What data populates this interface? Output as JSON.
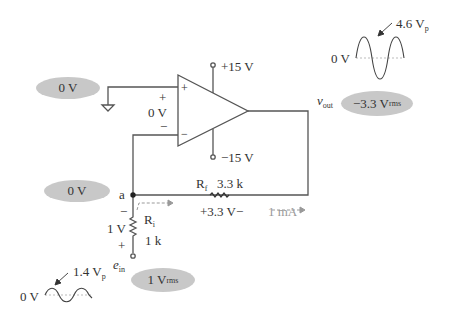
{
  "circuit": {
    "type": "inverting op-amp amplifier",
    "supply_pos": "+15 V",
    "supply_neg": "−15 V",
    "opamp_plus_sign": "+",
    "opamp_minus_sign": "−",
    "diff_plus": "+",
    "diff_voltage": "0 V",
    "diff_minus": "−",
    "node_a_label": "a",
    "rf_name": "R",
    "rf_sub": "f",
    "rf_value": "3.3 k",
    "rf_drop": "+3.3 V−",
    "current_label": "1 mA",
    "ri_name": "R",
    "ri_sub": "i",
    "ri_value": "1 k",
    "ri_minus": "−",
    "ri_drop": "1 V",
    "ri_plus": "+",
    "ein_name": "e",
    "ein_sub": "in",
    "vout_name": "v",
    "vout_sub": "out"
  },
  "badges": {
    "noninv_input": "0 V",
    "node_a": "0 V",
    "input_main": "1 V",
    "input_sub": "rms",
    "output_main": "−3.3 V",
    "output_sub": "rms"
  },
  "waveforms": {
    "output": {
      "zero_label": "0 V",
      "peak_main": "4.6 V",
      "peak_sub": "p"
    },
    "input": {
      "zero_label": "0 V",
      "peak_main": "1.4 V",
      "peak_sub": "p"
    }
  },
  "colors": {
    "wire": "#555555",
    "badge": "#c8c8c8",
    "current": "#999999"
  }
}
